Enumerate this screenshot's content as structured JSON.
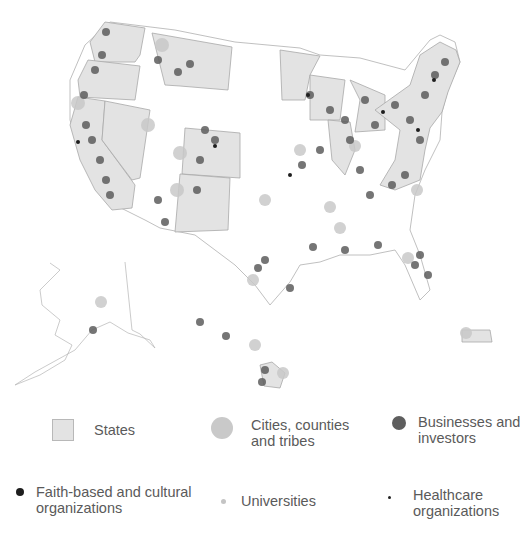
{
  "map": {
    "title": "",
    "region": "United States (incl. Alaska, Hawaii, Puerto Rico)",
    "shaded_states": [
      "Washington",
      "Oregon",
      "California",
      "Nevada",
      "Montana",
      "Colorado",
      "New Mexico",
      "Minnesota",
      "Wisconsin",
      "Michigan",
      "Illinois",
      "New York",
      "Vermont",
      "New Hampshire",
      "Maine",
      "Massachusetts",
      "Connecticut",
      "Rhode Island",
      "New Jersey",
      "Pennsylvania",
      "Delaware",
      "Maryland",
      "Virginia",
      "North Carolina",
      "Hawaii",
      "Puerto Rico"
    ],
    "colors": {
      "state_fill": "#e3e3e3",
      "state_border": "#a8a8a8",
      "city": "#c9c9c9",
      "business": "#5e5e5e",
      "faith": "#1e1e1e",
      "university": "#c4c4c4",
      "healthcare": "#222222"
    }
  },
  "legend": {
    "items": [
      {
        "id": "states",
        "label_lines": [
          "States"
        ],
        "icon": "square-swatch"
      },
      {
        "id": "cities",
        "label_lines": [
          "Cities, counties",
          "and tribes"
        ],
        "icon": "large-circle"
      },
      {
        "id": "businesses",
        "label_lines": [
          "Businesses and",
          "investors"
        ],
        "icon": "medium-circle"
      },
      {
        "id": "faith",
        "label_lines": [
          "Faith-based and cultural",
          "organizations"
        ],
        "icon": "small-circle"
      },
      {
        "id": "universities",
        "label_lines": [
          "Universities"
        ],
        "icon": "tiny-circle"
      },
      {
        "id": "healthcare",
        "label_lines": [
          "Healthcare",
          "organizations"
        ],
        "icon": "dot"
      }
    ]
  }
}
